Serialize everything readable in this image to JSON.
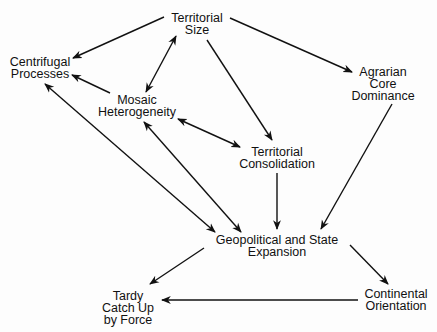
{
  "diagram": {
    "nodes": {
      "territorial_size": {
        "lines": [
          "Territorial",
          "Size"
        ]
      },
      "centrifugal_processes": {
        "lines": [
          "Centrifugal",
          "Processes"
        ]
      },
      "mosaic_heterogeneity": {
        "lines": [
          "Mosaic",
          "Heterogeneity"
        ]
      },
      "agrarian_core_dominance": {
        "lines": [
          "Agrarian",
          "Core",
          "Dominance"
        ]
      },
      "territorial_consolidation": {
        "lines": [
          "Territorial",
          "Consolidation"
        ]
      },
      "geopolitical_state_expansion": {
        "lines": [
          "Geopolitical and  State",
          "Expansion"
        ]
      },
      "tardy_catch_up": {
        "lines": [
          "Tardy",
          "Catch Up",
          "by  Force"
        ]
      },
      "continental_orientation": {
        "lines": [
          "Continental",
          "Orientation"
        ]
      }
    },
    "edges": [
      {
        "from": "Territorial Size",
        "to": "Centrifugal Processes",
        "direction": "forward"
      },
      {
        "from": "Territorial Size",
        "to": "Mosaic Heterogeneity",
        "direction": "both"
      },
      {
        "from": "Territorial Size",
        "to": "Territorial Consolidation",
        "direction": "forward"
      },
      {
        "from": "Territorial Size",
        "to": "Agrarian Core Dominance",
        "direction": "forward"
      },
      {
        "from": "Mosaic Heterogeneity",
        "to": "Centrifugal Processes",
        "direction": "forward"
      },
      {
        "from": "Mosaic Heterogeneity",
        "to": "Territorial Consolidation",
        "direction": "both"
      },
      {
        "from": "Mosaic Heterogeneity",
        "to": "Geopolitical and State Expansion",
        "direction": "both"
      },
      {
        "from": "Centrifugal Processes",
        "to": "Geopolitical and State Expansion",
        "direction": "both"
      },
      {
        "from": "Territorial Consolidation",
        "to": "Geopolitical and State Expansion",
        "direction": "forward"
      },
      {
        "from": "Agrarian Core Dominance",
        "to": "Geopolitical and State Expansion",
        "direction": "forward"
      },
      {
        "from": "Geopolitical and State Expansion",
        "to": "Tardy Catch Up by Force",
        "direction": "forward"
      },
      {
        "from": "Geopolitical and State Expansion",
        "to": "Continental Orientation",
        "direction": "forward"
      },
      {
        "from": "Continental Orientation",
        "to": "Tardy Catch Up by Force",
        "direction": "forward"
      }
    ],
    "colors": {
      "ink": "#111111",
      "background": "#fdfdfd"
    }
  }
}
